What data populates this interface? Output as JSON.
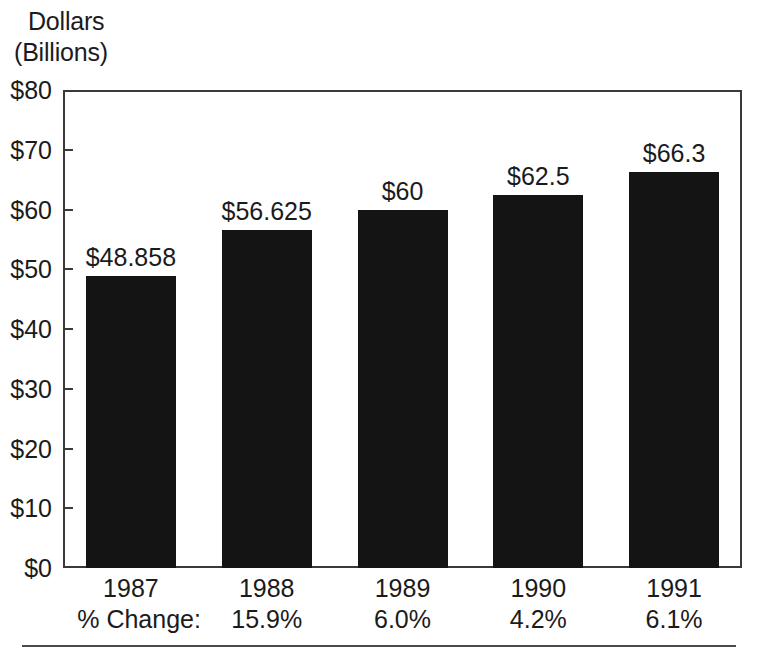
{
  "axis_title": {
    "line1": "Dollars",
    "line2": "(Billions)"
  },
  "chart_data": {
    "type": "bar",
    "title": "",
    "subtitle": "",
    "xlabel": "",
    "ylabel": "Dollars (Billions)",
    "ylim": [
      0,
      80
    ],
    "ytick_labels": [
      "$80",
      "$70",
      "$60",
      "$50",
      "$40",
      "$30",
      "$20",
      "$10",
      "$0"
    ],
    "ytick_values": [
      80,
      70,
      60,
      50,
      40,
      30,
      20,
      10,
      0
    ],
    "grid": false,
    "legend": "none",
    "bar_color": "#141414",
    "categories": [
      "1987",
      "1988",
      "1989",
      "1990",
      "1991"
    ],
    "values": [
      48.858,
      56.625,
      60,
      62.5,
      66.3
    ],
    "value_labels": [
      "$48.858",
      "$56.625",
      "$60",
      "$62.5",
      "$66.3"
    ],
    "secondary_row": {
      "label": "% Change:",
      "values": [
        "",
        "15.9%",
        "6.0%",
        "4.2%",
        "6.1%"
      ]
    }
  }
}
